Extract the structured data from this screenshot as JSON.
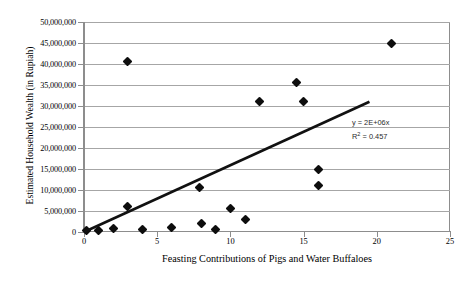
{
  "chart_data": {
    "type": "scatter",
    "title": "",
    "xlabel": "Feasting Contributions of Pigs and Water Buffaloes",
    "ylabel": "Estimated Household Wealth (in Rupiah)",
    "xlim": [
      0,
      25
    ],
    "ylim": [
      0,
      50000000
    ],
    "xticks": [
      0,
      5,
      10,
      15,
      20,
      25
    ],
    "xtick_labels": [
      "0",
      "5",
      "10",
      "15",
      "20",
      "25"
    ],
    "yticks": [
      0,
      5000000,
      10000000,
      15000000,
      20000000,
      25000000,
      30000000,
      35000000,
      40000000,
      45000000,
      50000000
    ],
    "ytick_labels": [
      "0",
      "5,000,000",
      "10,000,000",
      "15,000,000",
      "20,000,000",
      "25,000,000",
      "30,000,000",
      "35,000,000",
      "40,000,000",
      "45,000,000",
      "50,000,000"
    ],
    "grid": true,
    "grid_axis": "y",
    "legend": false,
    "marker_style": "filled-diamond",
    "marker_color": "#0d0d0d",
    "series": [
      {
        "name": "Households",
        "points": [
          {
            "x": 0.2,
            "y": 300000
          },
          {
            "x": 1.0,
            "y": 300000
          },
          {
            "x": 2.0,
            "y": 800000
          },
          {
            "x": 3.0,
            "y": 6000000
          },
          {
            "x": 3.0,
            "y": 40500000
          },
          {
            "x": 4.0,
            "y": 700000
          },
          {
            "x": 6.0,
            "y": 1000000
          },
          {
            "x": 7.9,
            "y": 10500000
          },
          {
            "x": 8.0,
            "y": 2100000
          },
          {
            "x": 9.0,
            "y": 700000
          },
          {
            "x": 10.0,
            "y": 5700000
          },
          {
            "x": 11.0,
            "y": 3000000
          },
          {
            "x": 12.0,
            "y": 31000000
          },
          {
            "x": 14.5,
            "y": 35500000
          },
          {
            "x": 15.0,
            "y": 31000000
          },
          {
            "x": 16.0,
            "y": 15000000
          },
          {
            "x": 16.0,
            "y": 11000000
          },
          {
            "x": 21.0,
            "y": 44800000
          }
        ]
      }
    ],
    "trendline": {
      "type": "linear",
      "slope": 2000000,
      "intercept": 0,
      "x_start": 0,
      "x_end": 19.5,
      "y_start": 0,
      "y_end": 31000000,
      "color": "#111111",
      "width": 2.6
    },
    "annotations": {
      "equation": "y = 2E+06x",
      "r_squared_prefix": "R",
      "r_squared_sup": "2",
      "r_squared_value": " = 0.457"
    }
  },
  "axes": {
    "y_title": "Estimated Household Wealth (in Rupiah)",
    "x_title": "Feasting Contributions of Pigs and Water Buffaloes"
  }
}
